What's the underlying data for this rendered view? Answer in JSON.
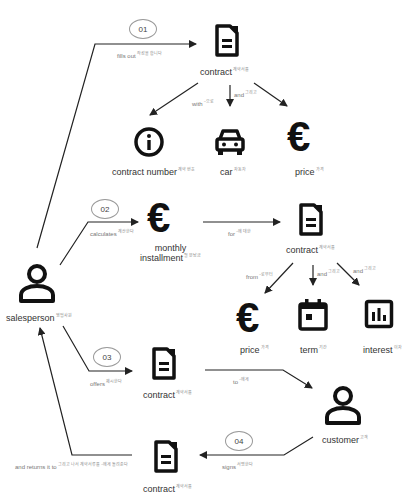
{
  "steps": [
    "01",
    "02",
    "03",
    "04"
  ],
  "nodes": {
    "salesperson": {
      "label": "salesperson",
      "ko": "영업사원"
    },
    "contract1": {
      "label": "contract",
      "ko": "계약서를"
    },
    "contract_number": {
      "label": "contract number",
      "ko": "계약 번호"
    },
    "car": {
      "label": "car",
      "ko": "자동차"
    },
    "price1": {
      "label": "price",
      "ko": "가격"
    },
    "monthly_installment": {
      "label1": "monthly",
      "label2": "installment",
      "ko": "월 분납금"
    },
    "contract2": {
      "label": "contract",
      "ko": "계약서를"
    },
    "price2": {
      "label": "price",
      "ko": "가격"
    },
    "term": {
      "label": "term",
      "ko": "기간"
    },
    "interest": {
      "label": "interest",
      "ko": "이자"
    },
    "contract3": {
      "label": "contract",
      "ko": "계약서를"
    },
    "customer": {
      "label": "customer",
      "ko": "고객"
    },
    "contract4": {
      "label": "contract",
      "ko": "계약서를"
    }
  },
  "edges": {
    "fills_out": {
      "label": "fills out",
      "ko": "작성을 합니다"
    },
    "with": {
      "label": "with",
      "ko": "~으로"
    },
    "and1": {
      "label": "and",
      "ko": "그리고"
    },
    "calculates": {
      "label": "calculates",
      "ko": "계산한다"
    },
    "for": {
      "label": "for",
      "ko": "~에 대한"
    },
    "from": {
      "label": "from",
      "ko": "~로부터"
    },
    "and2": {
      "label": "and",
      "ko": "그리고"
    },
    "and3": {
      "label": "and",
      "ko": "그리고"
    },
    "offers": {
      "label": "offers",
      "ko": "제시한다"
    },
    "to": {
      "label": "to",
      "ko": "~에게"
    },
    "signs": {
      "label": "signs",
      "ko": "서명한다"
    },
    "returns": {
      "label": "and returns it to",
      "ko": "그리고 나서 계약서류를 ~에게 돌려준다"
    }
  },
  "colors": {
    "icon": "#111111",
    "line": "#222222",
    "edge_text": "#777777"
  }
}
